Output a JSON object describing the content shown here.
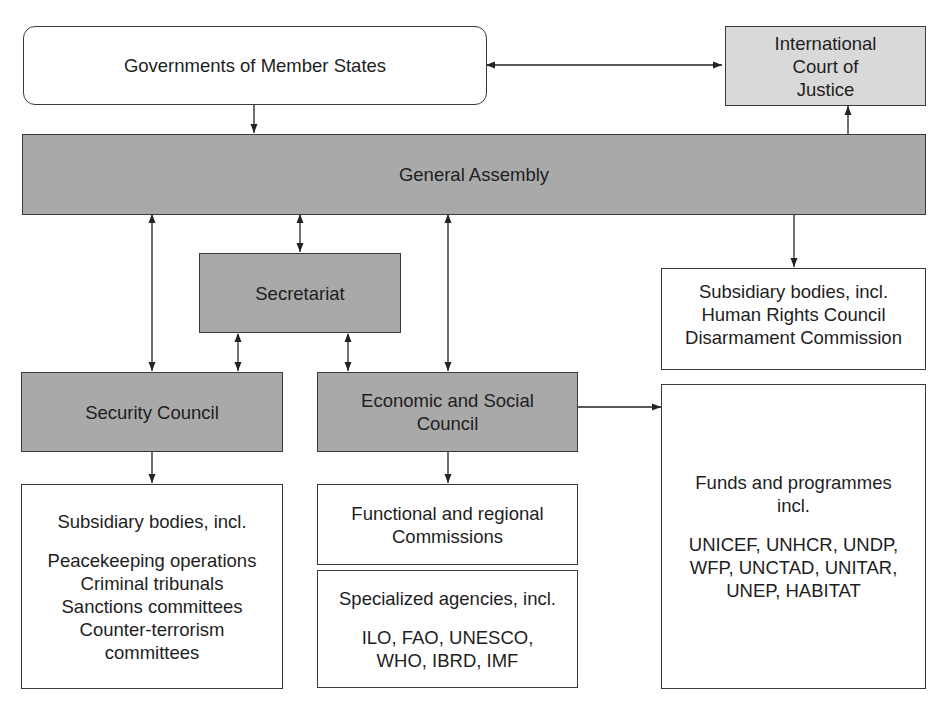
{
  "diagram": {
    "nodes": {
      "member_states": {
        "label": "Governments of Member States"
      },
      "icj": {
        "lines": [
          "International",
          "Court of",
          "Justice"
        ]
      },
      "general_assembly": {
        "label": "General Assembly"
      },
      "secretariat": {
        "label": "Secretariat"
      },
      "ga_subsidiary": {
        "lines": [
          "Subsidiary bodies, incl.",
          "Human Rights Council",
          "Disarmament Commission"
        ]
      },
      "security_council": {
        "label": "Security Council"
      },
      "ecosoc": {
        "lines": [
          "Economic and Social",
          "Council"
        ]
      },
      "sc_subsidiary": {
        "heading": "Subsidiary bodies, incl.",
        "lines": [
          "Peacekeeping operations",
          "Criminal tribunals",
          "Sanctions committees",
          "Counter-terrorism",
          "committees"
        ]
      },
      "commissions": {
        "lines": [
          "Functional and regional",
          "Commissions"
        ]
      },
      "specialized_agencies": {
        "heading": "Specialized agencies, incl.",
        "lines": [
          "ILO, FAO, UNESCO,",
          "WHO, IBRD, IMF"
        ]
      },
      "funds_programmes": {
        "heading_lines": [
          "Funds and programmes",
          "incl."
        ],
        "lines": [
          "UNICEF, UNHCR, UNDP,",
          "WFP, UNCTAD, UNITAR,",
          "UNEP, HABITAT"
        ]
      }
    },
    "edges": [
      {
        "from": "member_states",
        "to": "icj",
        "type": "bidirectional"
      },
      {
        "from": "member_states",
        "to": "general_assembly",
        "type": "directed"
      },
      {
        "from": "general_assembly",
        "to": "icj",
        "type": "directed"
      },
      {
        "from": "general_assembly",
        "to": "secretariat",
        "type": "bidirectional"
      },
      {
        "from": "general_assembly",
        "to": "security_council",
        "type": "bidirectional"
      },
      {
        "from": "general_assembly",
        "to": "ecosoc",
        "type": "bidirectional"
      },
      {
        "from": "general_assembly",
        "to": "ga_subsidiary",
        "type": "directed"
      },
      {
        "from": "secretariat",
        "to": "security_council",
        "type": "bidirectional"
      },
      {
        "from": "secretariat",
        "to": "ecosoc",
        "type": "bidirectional"
      },
      {
        "from": "security_council",
        "to": "sc_subsidiary",
        "type": "directed"
      },
      {
        "from": "ecosoc",
        "to": "commissions",
        "type": "directed"
      },
      {
        "from": "ecosoc",
        "to": "funds_programmes",
        "type": "directed"
      }
    ],
    "colors": {
      "principal_organ_fill": "#a9a9a9",
      "icj_fill": "#d9d9d9",
      "border": "#3a3a3a",
      "subsidiary_fill": "#ffffff"
    }
  }
}
